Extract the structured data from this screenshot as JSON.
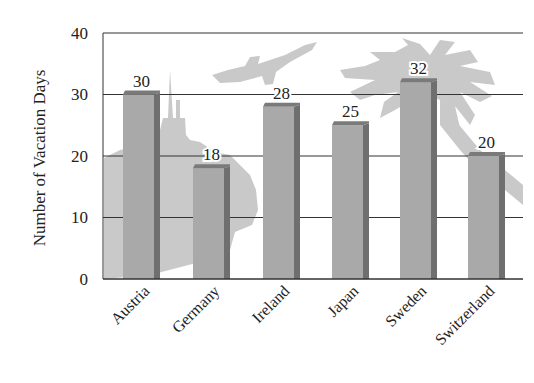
{
  "chart_data": {
    "type": "bar",
    "title": "",
    "xlabel": "",
    "ylabel": "Number of Vacation Days",
    "categories": [
      "Austria",
      "Germany",
      "Ireland",
      "Japan",
      "Sweden",
      "Switzerland"
    ],
    "values": [
      30,
      18,
      28,
      25,
      32,
      20
    ],
    "data_labels": [
      "30",
      "18",
      "28",
      "25",
      "32",
      "20"
    ],
    "ylim": [
      0,
      40
    ],
    "yticks": [
      0,
      10,
      20,
      30,
      40
    ],
    "ytick_labels": [
      "0",
      "10",
      "20",
      "30",
      "40"
    ],
    "grid": true,
    "legend": null,
    "style": "3d-bars",
    "background_illustrations": [
      "castle-silhouette",
      "airplane-silhouette",
      "palm-tree-silhouette"
    ]
  },
  "colors": {
    "bar_front": "#a9a9a9",
    "bar_side": "#6f6f6f",
    "bar_top": "#7a7a7a",
    "grid": "#333333",
    "silhouette": "#c9c9c9",
    "text": "#222222"
  }
}
